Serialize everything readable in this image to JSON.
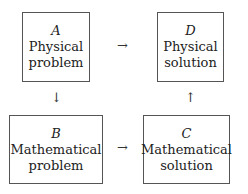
{
  "diagram": {
    "boxes": {
      "A": {
        "letter": "A",
        "line1": "Physical",
        "line2": "problem"
      },
      "B": {
        "letter": "B",
        "line1": "Mathematical",
        "line2": "problem"
      },
      "C": {
        "letter": "C",
        "line1": "Mathematical",
        "line2": "solution"
      },
      "D": {
        "letter": "D",
        "line1": "Physical",
        "line2": "solution"
      }
    },
    "arrows": {
      "a_to_d": "→",
      "a_to_b": "↓",
      "b_to_c": "→",
      "c_to_d": "↑"
    }
  }
}
